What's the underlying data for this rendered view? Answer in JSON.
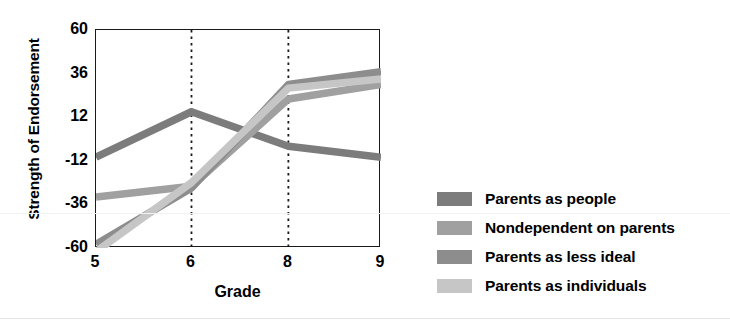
{
  "chart_data": {
    "type": "line",
    "title": "",
    "xlabel": "Grade",
    "ylabel": "Strength of Endorsement",
    "categories": [
      "5",
      "6",
      "8",
      "9"
    ],
    "x_tick_labels": [
      "5",
      "6",
      "8",
      "9"
    ],
    "y_tick_labels": [
      "60",
      "36",
      "12",
      "-12",
      "-36",
      "-60"
    ],
    "y_ticks": [
      60,
      36,
      12,
      -12,
      -36,
      -60
    ],
    "ylim": [
      -60,
      60
    ],
    "grid": "vertical dotted gridlines at grade 6 and grade 8",
    "legend_position": "right",
    "series": [
      {
        "name": "Parents as people",
        "color": "#7c7c7c",
        "values": [
          -10,
          15,
          -4,
          -10
        ]
      },
      {
        "name": "Nondependent on parents",
        "color": "#a0a0a0",
        "values": [
          -32,
          -26,
          22,
          30
        ]
      },
      {
        "name": "Parents as less ideal",
        "color": "#8d8d8d",
        "values": [
          -58,
          -27,
          30,
          37
        ]
      },
      {
        "name": "Parents as individuals",
        "color": "#c6c6c6",
        "values": [
          -62,
          -24,
          28,
          33
        ]
      }
    ]
  },
  "axes": {
    "y_title": "Strength of Endorsement",
    "x_title": "Grade"
  },
  "legend": {
    "items": [
      {
        "label": "Parents as people",
        "color": "#7c7c7c"
      },
      {
        "label": "Nondependent on parents",
        "color": "#a0a0a0"
      },
      {
        "label": "Parents as less ideal",
        "color": "#8d8d8d"
      },
      {
        "label": "Parents as individuals",
        "color": "#c6c6c6"
      }
    ]
  },
  "colors": {
    "axis": "#1a1a1a",
    "text": "#000000",
    "gridline": "#1a1a1a",
    "background": "#ffffff"
  }
}
